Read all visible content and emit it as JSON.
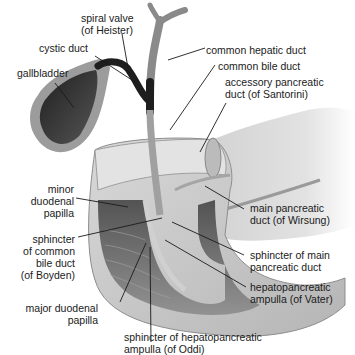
{
  "diagram": {
    "type": "anatomical-illustration",
    "labels": {
      "spiral_valve": [
        "spiral valve",
        "(of Heister)"
      ],
      "cystic_duct": [
        "cystic duct"
      ],
      "gallbladder": [
        "gallbladder"
      ],
      "common_hepatic_duct": [
        "common hepatic duct"
      ],
      "common_bile_duct": [
        "common bile duct"
      ],
      "accessory_pancreatic_duct": [
        "accessory pancreatic",
        "duct (of Santorini)"
      ],
      "minor_duodenal_papilla": [
        "minor",
        "duodenal",
        "papilla"
      ],
      "sphincter_common_bile_duct": [
        "sphincter",
        "of common",
        "bile duct",
        "(of Boyden)"
      ],
      "main_pancreatic_duct": [
        "main pancreatic",
        "duct (of Wirsung)"
      ],
      "sphincter_main_pancreatic_duct": [
        "sphincter of main",
        "pancreatic duct"
      ],
      "hepatopancreatic_ampulla": [
        "hepatopancreatic",
        "ampulla (of Vater)"
      ],
      "major_duodenal_papilla": [
        "major duodenal",
        "papilla"
      ],
      "sphincter_hepatopancreatic_ampulla": [
        "sphincter of hepatopancreatic",
        "ampulla (of Oddi)"
      ]
    },
    "colors": {
      "tissue_light": "#e6e6e6",
      "tissue_mid": "#bdbdbd",
      "tissue_dark": "#5a5a5a",
      "bile_dark": "#2a2a2a",
      "leader_line": "#1a1a1a",
      "text": "#1a1a1a"
    }
  }
}
